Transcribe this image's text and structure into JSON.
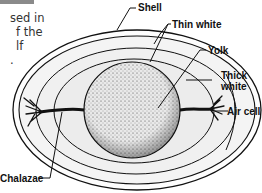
{
  "page_fragment": {
    "header_bar_color": "#8a8a8a",
    "text_lines": [
      "sed in",
      "f the",
      "lf",
      "."
    ]
  },
  "diagram": {
    "labels": {
      "shell": "Shell",
      "thin_white": "Thin white",
      "yolk": "Yolk",
      "thick_white_line1": "Thick",
      "thick_white_line2": "white",
      "air_cell": "Air cell",
      "chalazae": "Chalazae"
    }
  }
}
